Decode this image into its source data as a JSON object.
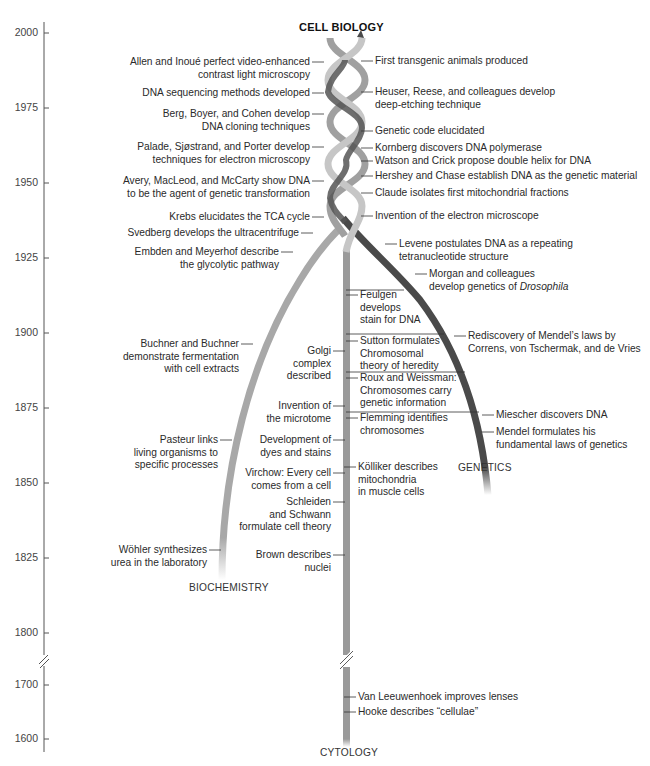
{
  "title": "CELL BIOLOGY",
  "colors": {
    "axis": "#555555",
    "cytology": "#9a9a9a",
    "biochemistry": "#a8a8a8",
    "genetics": "#4a4a4a",
    "helix_light": "#c4c4c4",
    "text": "#2a2a2a"
  },
  "axis": {
    "ticks": [
      {
        "label": "2000",
        "y": 33
      },
      {
        "label": "1975",
        "y": 108
      },
      {
        "label": "1950",
        "y": 183
      },
      {
        "label": "1925",
        "y": 258
      },
      {
        "label": "1900",
        "y": 333
      },
      {
        "label": "1875",
        "y": 408
      },
      {
        "label": "1850",
        "y": 483
      },
      {
        "label": "1825",
        "y": 558
      },
      {
        "label": "1800",
        "y": 633
      },
      {
        "label": "1700",
        "y": 685
      },
      {
        "label": "1600",
        "y": 739
      }
    ],
    "break_between": [
      "1800",
      "1700"
    ]
  },
  "branches": {
    "cytology": "CYTOLOGY",
    "biochemistry": "BIOCHEMISTRY",
    "genetics": "GENETICS"
  },
  "events_left": [
    {
      "text": "Allen and Inoué perfect video-enhanced\ncontrast light microscopy",
      "x": 310,
      "y": 62
    },
    {
      "text": "DNA sequencing methods developed",
      "x": 310,
      "y": 93
    },
    {
      "text": "Berg, Boyer, and Cohen develop\nDNA cloning techniques",
      "x": 310,
      "y": 114
    },
    {
      "text": "Palade, Sjøstrand, and Porter develop\ntechniques for electron microscopy",
      "x": 310,
      "y": 147
    },
    {
      "text": "Avery, MacLeod, and McCarty show DNA\nto be the agent of genetic transformation",
      "x": 310,
      "y": 181
    },
    {
      "text": "Krebs elucidates the TCA cycle",
      "x": 310,
      "y": 217
    },
    {
      "text": "Svedberg develops the ultracentrifuge",
      "x": 299,
      "y": 233
    },
    {
      "text": "Embden and Meyerhof describe\nthe glycolytic pathway",
      "x": 279,
      "y": 252
    },
    {
      "text": "Buchner and Buchner\ndemonstrate fermentation\nwith cell extracts",
      "x": 239,
      "y": 344
    },
    {
      "text": "Pasteur links\nliving organisms to\nspecific processes",
      "x": 218,
      "y": 440
    },
    {
      "text": "Wöhler synthesizes\nurea in the laboratory",
      "x": 207,
      "y": 550
    },
    {
      "text": "Golgi\ncomplex\ndescribed",
      "x": 331,
      "y": 351
    },
    {
      "text": "Invention of\nthe microtome",
      "x": 331,
      "y": 406
    },
    {
      "text": "Development of\ndyes and stains",
      "x": 331,
      "y": 440
    },
    {
      "text": "Virchow: Every cell\ncomes from a cell",
      "x": 331,
      "y": 473
    },
    {
      "text": "Schleiden\nand Schwann\nformulate cell theory",
      "x": 331,
      "y": 502
    },
    {
      "text": "Brown describes\nnuclei",
      "x": 331,
      "y": 555
    }
  ],
  "events_right": [
    {
      "text": "First transgenic animals produced",
      "x": 375,
      "y": 61
    },
    {
      "text": "Heuser, Reese, and colleagues develop\ndeep-etching technique",
      "x": 375,
      "y": 92
    },
    {
      "text": "Genetic code elucidated",
      "x": 375,
      "y": 131
    },
    {
      "text": "Kornberg discovers DNA polymerase",
      "x": 375,
      "y": 148
    },
    {
      "text": "Watson and Crick propose double helix for DNA",
      "x": 375,
      "y": 161
    },
    {
      "text": "Hershey and Chase establish DNA as the genetic material",
      "x": 375,
      "y": 176
    },
    {
      "text": "Claude isolates first mitochondrial fractions",
      "x": 375,
      "y": 193
    },
    {
      "text": "Invention of the electron microscope",
      "x": 375,
      "y": 216
    },
    {
      "text": "Levene postulates DNA as a repeating\ntetranucleotide structure",
      "x": 399,
      "y": 244
    },
    {
      "text": "Morgan and colleagues\ndevelop genetics of ",
      "italic": "Drosophila",
      "x": 429,
      "y": 274
    },
    {
      "text": "Feulgen\ndevelops\nstain for DNA",
      "x": 360,
      "y": 295
    },
    {
      "text": "Rediscovery of Mendel’s laws by\nCorrens, von Tschermak, and de Vries",
      "x": 468,
      "y": 336
    },
    {
      "text": "Sutton formulates\nChromosomal\ntheory of heredity",
      "x": 360,
      "y": 341
    },
    {
      "text": "Roux and Weissman:\nChromosomes carry\ngenetic information",
      "x": 360,
      "y": 378
    },
    {
      "text": "Flemming identifies\nchromosomes",
      "x": 360,
      "y": 418
    },
    {
      "text": "Miescher discovers DNA",
      "x": 496,
      "y": 415
    },
    {
      "text": "Mendel formulates his\nfundamental laws of genetics",
      "x": 496,
      "y": 432
    },
    {
      "text": "Kölliker describes\nmitochondria\nin muscle cells",
      "x": 358,
      "y": 467
    },
    {
      "text": "Van Leeuwenhoek improves lenses",
      "x": 358,
      "y": 697
    },
    {
      "text": "Hooke describes “cellulae”",
      "x": 358,
      "y": 712
    }
  ]
}
